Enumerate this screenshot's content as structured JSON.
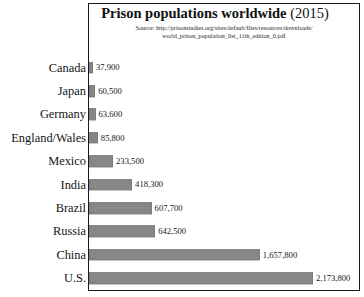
{
  "chart_data": {
    "type": "bar",
    "orientation": "horizontal",
    "title": "Prison populations worldwide (2015)",
    "title_main": "Prison populations worldwide",
    "title_year": "(2015)",
    "subtitle_line1": "Source: http://prisonstudies.org/sites/default/files/resources/downloads/",
    "subtitle_line2": "world_prison_population_list_11th_edition_0.pdf",
    "xlabel": "",
    "ylabel": "",
    "grid": false,
    "legend": false,
    "xlim": [
      0,
      2400000
    ],
    "bar_color": "#878787",
    "categories": [
      "Canada",
      "Japan",
      "Germany",
      "England/Wales",
      "Mexico",
      "India",
      "Brazil",
      "Russia",
      "China",
      "U.S."
    ],
    "values": [
      37900,
      60500,
      63600,
      85800,
      233500,
      418300,
      607700,
      642500,
      1657800,
      2173800
    ],
    "value_labels": [
      "37,900",
      "60,500",
      "63,600",
      "85,800",
      "233,500",
      "418,300",
      "607,700",
      "642,500",
      "1,657,800",
      "2,173,800"
    ],
    "bars": [
      {
        "label": "Canada",
        "value": 37900,
        "value_label": "37,900",
        "pct": 1.7
      },
      {
        "label": "Japan",
        "value": 60500,
        "value_label": "60,500",
        "pct": 2.8
      },
      {
        "label": "Germany",
        "value": 63600,
        "value_label": "63,600",
        "pct": 2.9
      },
      {
        "label": "England/Wales",
        "value": 85800,
        "value_label": "85,800",
        "pct": 3.9
      },
      {
        "label": "Mexico",
        "value": 233500,
        "value_label": "233,500",
        "pct": 10.7
      },
      {
        "label": "India",
        "value": 418300,
        "value_label": "418,300",
        "pct": 19.2
      },
      {
        "label": "Brazil",
        "value": 607700,
        "value_label": "607,700",
        "pct": 28.0
      },
      {
        "label": "Russia",
        "value": 642500,
        "value_label": "642,500",
        "pct": 29.6
      },
      {
        "label": "China",
        "value": 1657800,
        "value_label": "1,657,800",
        "pct": 76.3
      },
      {
        "label": "U.S.",
        "value": 2173800,
        "value_label": "2,173,800",
        "pct": 100.0
      }
    ]
  }
}
